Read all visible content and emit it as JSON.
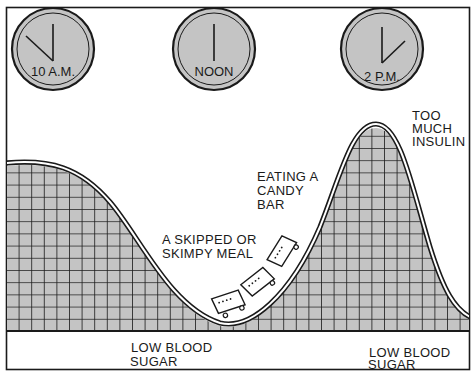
{
  "diagram": {
    "type": "blood-sugar-roller-coaster",
    "colors": {
      "fill": "#c4c4c4",
      "grid": "#1a1a1a",
      "line": "#1a1a1a",
      "background": "#ffffff"
    }
  },
  "clocks": [
    {
      "label": "10 A.M.",
      "cx": 53,
      "cy": 49,
      "hand_angle_deg": -45
    },
    {
      "label": "NOON",
      "cx": 214,
      "cy": 49,
      "hand_angle_deg": 0
    },
    {
      "label": "2 P.M.",
      "cx": 382,
      "cy": 49,
      "hand_angle_deg": 45
    }
  ],
  "annotations": {
    "too_much_insulin": {
      "lines": [
        "TOO",
        "MUCH",
        "INSULIN"
      ]
    },
    "eating_candy_bar": {
      "lines": [
        "EATING A",
        "CANDY",
        "BAR"
      ]
    },
    "skipped_meal": {
      "lines": [
        "A SKIPPED OR",
        "SKIMPY MEAL"
      ]
    },
    "low_sugar_1": {
      "lines": [
        "LOW BLOOD",
        "SUGAR"
      ]
    },
    "low_sugar_2": {
      "lines": [
        "LOW BLOOD",
        "SUGAR"
      ]
    }
  }
}
